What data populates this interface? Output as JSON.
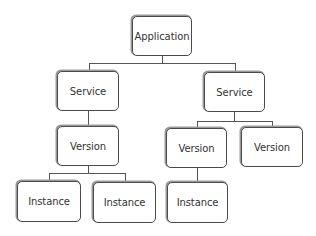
{
  "diagram": {
    "type": "hierarchy-tree",
    "colors": {
      "box_border": "#4a4a4a",
      "line": "#555555",
      "text": "#333333",
      "background": "#ffffff"
    },
    "nodes": {
      "application": {
        "label": "Application",
        "x": 132,
        "y": 16,
        "w": 60,
        "h": 40
      },
      "service_left": {
        "label": "Service",
        "x": 57,
        "y": 71,
        "w": 62,
        "h": 40
      },
      "service_right": {
        "label": "Service",
        "x": 204,
        "y": 72,
        "w": 61,
        "h": 40
      },
      "version_left": {
        "label": "Version",
        "x": 57,
        "y": 126,
        "w": 62,
        "h": 40
      },
      "version_right_a": {
        "label": "Version",
        "x": 166,
        "y": 128,
        "w": 61,
        "h": 40
      },
      "version_right_b": {
        "label": "Version",
        "x": 241,
        "y": 127,
        "w": 62,
        "h": 40
      },
      "instance_left_a": {
        "label": "Instance",
        "x": 17,
        "y": 181,
        "w": 64,
        "h": 41
      },
      "instance_left_b": {
        "label": "Instance",
        "x": 93,
        "y": 182,
        "w": 63,
        "h": 41
      },
      "instance_right": {
        "label": "Instance",
        "x": 167,
        "y": 182,
        "w": 61,
        "h": 41
      }
    },
    "edges": [
      [
        "Application",
        "Service (left)"
      ],
      [
        "Application",
        "Service (right)"
      ],
      [
        "Service (left)",
        "Version (left)"
      ],
      [
        "Service (right)",
        "Version (right A)"
      ],
      [
        "Service (right)",
        "Version (right B)"
      ],
      [
        "Version (left)",
        "Instance (left A)"
      ],
      [
        "Version (left)",
        "Instance (left B)"
      ],
      [
        "Version (right A)",
        "Instance (right)"
      ]
    ]
  }
}
